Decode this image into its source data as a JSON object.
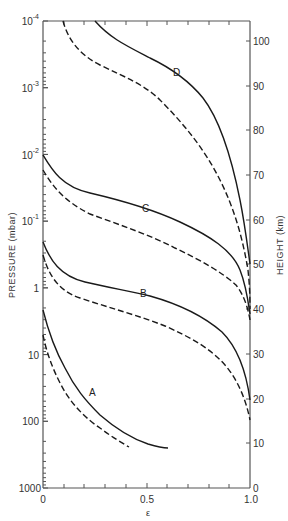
{
  "chart_data": {
    "type": "line",
    "title": "",
    "xlabel": "ε",
    "ylabel_left": "PRESSURE (mbar)",
    "ylabel_right": "HEIGHT (km)",
    "xlim": [
      0,
      1.0
    ],
    "ylim_left": [
      1000,
      0.0001
    ],
    "ylim_left_scale": "log",
    "ylim_right": [
      0,
      105
    ],
    "grid": false,
    "legend": "none; curves labeled inline",
    "x_ticks": [
      {
        "value": 0,
        "label": "0"
      },
      {
        "value": 0.5,
        "label": "0.5"
      },
      {
        "value": 1.0,
        "label": "1.0"
      }
    ],
    "y_left_ticks": [
      {
        "value": 0.0001,
        "base": "10",
        "exp": "-4"
      },
      {
        "value": 0.001,
        "base": "10",
        "exp": "-3"
      },
      {
        "value": 0.01,
        "base": "10",
        "exp": "-2"
      },
      {
        "value": 0.1,
        "base": "10",
        "exp": "-1"
      },
      {
        "value": 1,
        "base": "1",
        "exp": ""
      },
      {
        "value": 10,
        "base": "10",
        "exp": ""
      },
      {
        "value": 100,
        "base": "100",
        "exp": ""
      },
      {
        "value": 1000,
        "base": "1000",
        "exp": ""
      }
    ],
    "y_right_ticks": [
      "0",
      "10",
      "20",
      "30",
      "40",
      "50",
      "60",
      "70",
      "80",
      "90",
      "100"
    ],
    "series": [
      {
        "name": "A",
        "style": "solid",
        "points": [
          [
            0.0,
            1.8
          ],
          [
            0.05,
            7
          ],
          [
            0.12,
            20
          ],
          [
            0.2,
            45
          ],
          [
            0.3,
            90
          ],
          [
            0.45,
            170
          ],
          [
            0.6,
            260
          ]
        ]
      },
      {
        "name": "A",
        "style": "dashed",
        "points": [
          [
            0.0,
            3
          ],
          [
            0.04,
            10
          ],
          [
            0.1,
            40
          ],
          [
            0.18,
            90
          ],
          [
            0.3,
            170
          ],
          [
            0.42,
            260
          ]
        ]
      },
      {
        "name": "B",
        "style": "solid",
        "points": [
          [
            0.0,
            0.2
          ],
          [
            0.1,
            0.6
          ],
          [
            0.25,
            0.9
          ],
          [
            0.5,
            1.1
          ],
          [
            0.7,
            2
          ],
          [
            0.9,
            8
          ],
          [
            1.0,
            50
          ]
        ]
      },
      {
        "name": "B",
        "style": "dashed",
        "points": [
          [
            0.0,
            0.35
          ],
          [
            0.1,
            1.3
          ],
          [
            0.3,
            2.2
          ],
          [
            0.55,
            3.5
          ],
          [
            0.75,
            7
          ],
          [
            0.92,
            25
          ],
          [
            1.0,
            100
          ]
        ]
      },
      {
        "name": "C",
        "style": "solid",
        "points": [
          [
            0.0,
            0.01
          ],
          [
            0.1,
            0.035
          ],
          [
            0.3,
            0.06
          ],
          [
            0.5,
            0.1
          ],
          [
            0.7,
            0.2
          ],
          [
            0.9,
            0.5
          ],
          [
            1.0,
            0.9
          ]
        ]
      },
      {
        "name": "C",
        "style": "dashed",
        "points": [
          [
            0.0,
            0.02
          ],
          [
            0.1,
            0.07
          ],
          [
            0.3,
            0.14
          ],
          [
            0.55,
            0.25
          ],
          [
            0.75,
            0.45
          ],
          [
            0.92,
            1.2
          ],
          [
            1.0,
            2
          ]
        ]
      },
      {
        "name": "D",
        "style": "solid",
        "points": [
          [
            0.25,
            0.0001
          ],
          [
            0.4,
            0.00025
          ],
          [
            0.6,
            0.0006
          ],
          [
            0.7,
            0.0013
          ],
          [
            0.8,
            0.006
          ],
          [
            0.9,
            0.03
          ],
          [
            1.0,
            0.5
          ]
        ]
      },
      {
        "name": "D",
        "style": "dashed",
        "points": [
          [
            0.1,
            0.0001
          ],
          [
            0.2,
            0.0005
          ],
          [
            0.4,
            0.0013
          ],
          [
            0.6,
            0.004
          ],
          [
            0.75,
            0.015
          ],
          [
            0.9,
            0.07
          ],
          [
            0.98,
            0.5
          ]
        ]
      }
    ],
    "annotations": [
      "A",
      "B",
      "C",
      "D"
    ]
  },
  "labels": {
    "x_axis": "ε",
    "y_left": "PRESSURE  (mbar)",
    "y_right": "HEIGHT  (km)",
    "curve_a": "A",
    "curve_b": "B",
    "curve_c": "C",
    "curve_d": "D",
    "x_tick_0": "0",
    "x_tick_05": "0.5",
    "x_tick_1": "1.0",
    "yl_m4_base": "10",
    "yl_m4_exp": "-4",
    "yl_m3_base": "10",
    "yl_m3_exp": "-3",
    "yl_m2_base": "10",
    "yl_m2_exp": "-2",
    "yl_m1_base": "10",
    "yl_m1_exp": "-1",
    "yl_1": "1",
    "yl_10": "10",
    "yl_100": "100",
    "yl_1000": "1000",
    "yr_0": "0",
    "yr_10": "10",
    "yr_20": "20",
    "yr_30": "30",
    "yr_40": "40",
    "yr_50": "50",
    "yr_60": "60",
    "yr_70": "70",
    "yr_80": "80",
    "yr_90": "90",
    "yr_100": "100"
  },
  "colors": {
    "line": "#1a1a1a",
    "axis": "#555555"
  }
}
